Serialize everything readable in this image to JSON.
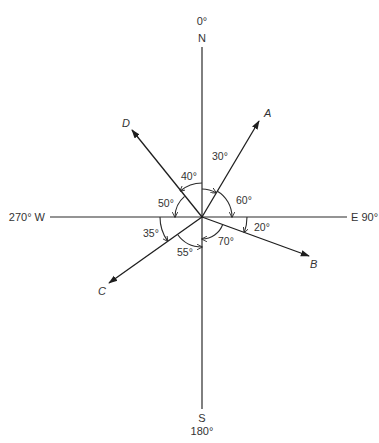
{
  "figure": {
    "colors": {
      "background": "#ffffff",
      "ink": "#2b2b2b"
    },
    "center": {
      "x": 202,
      "y": 217
    },
    "axes": {
      "north": {
        "degree_label": "0°",
        "letter": "N"
      },
      "east": {
        "label": "E 90°"
      },
      "south": {
        "letter": "S",
        "degree_label": "180°"
      },
      "west": {
        "label": "270° W"
      }
    },
    "vectors": [
      {
        "name": "A",
        "bearing_deg": 30
      },
      {
        "name": "B",
        "bearing_deg": 110
      },
      {
        "name": "C",
        "bearing_deg": 235
      },
      {
        "name": "D",
        "bearing_deg": 320
      }
    ],
    "angles": [
      {
        "label": "30°",
        "from": "N",
        "to": "A"
      },
      {
        "label": "60°",
        "from": "A",
        "to": "E"
      },
      {
        "label": "20°",
        "from": "E",
        "to": "B"
      },
      {
        "label": "70°",
        "from": "B",
        "to": "S"
      },
      {
        "label": "55°",
        "from": "C",
        "to": "S"
      },
      {
        "label": "35°",
        "from": "W",
        "to": "C"
      },
      {
        "label": "50°",
        "from": "D",
        "to": "W"
      },
      {
        "label": "40°",
        "from": "N",
        "to": "D"
      }
    ]
  }
}
